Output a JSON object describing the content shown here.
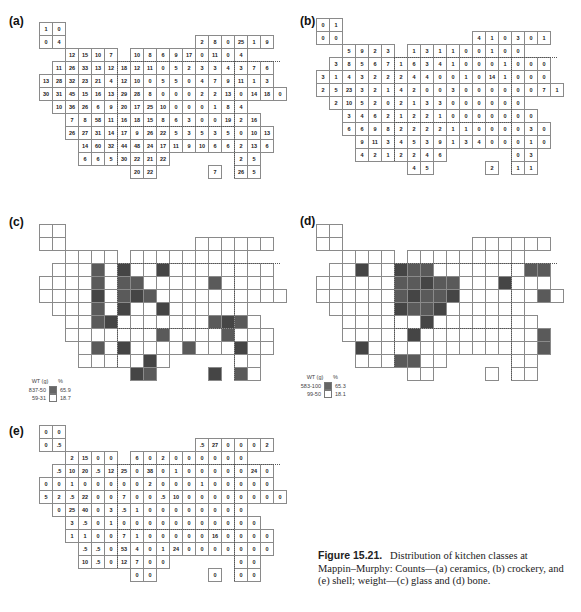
{
  "figure": {
    "number": "Figure 15.21.",
    "caption": "Distribution of kitchen classes at Mappin–Murphy: Counts—(a) ceramics, (b) crockery, and (e) shell; weight—(c) glass and (d) bone."
  },
  "panels": {
    "a": {
      "label": "(a)",
      "kind": "counts",
      "subject": "ceramics",
      "rows": [
        {
          "r": 0,
          "start": 0,
          "vals": [
            "1",
            "0"
          ]
        },
        {
          "r": 1,
          "start": 0,
          "vals": [
            "0",
            "4"
          ]
        },
        {
          "r": 1,
          "start": 12,
          "vals": [
            "2",
            "8",
            "0",
            "25",
            "1",
            "9"
          ]
        },
        {
          "r": 2,
          "start": 2,
          "vals": [
            "12",
            "15",
            "10",
            "7"
          ]
        },
        {
          "r": 2,
          "start": 7,
          "vals": [
            "10",
            "8",
            "6",
            "9",
            "17",
            "0",
            "11",
            "0",
            "4"
          ]
        },
        {
          "r": 3,
          "start": 1,
          "vals": [
            "11",
            "26",
            "33",
            "13",
            "12",
            "18",
            "12",
            "11",
            "0",
            "5",
            "2",
            "3",
            "3",
            "4",
            "3",
            "7",
            "6"
          ]
        },
        {
          "r": 4,
          "start": 0,
          "vals": [
            "13",
            "28",
            "32",
            "23",
            "21",
            "4",
            "12",
            "10",
            "0",
            "5",
            "5",
            "0",
            "4",
            "7",
            "9",
            "11",
            "1",
            "3"
          ]
        },
        {
          "r": 5,
          "start": 0,
          "vals": [
            "30",
            "31",
            "45",
            "15",
            "16",
            "13",
            "29",
            "28",
            "8",
            "0",
            "0",
            "0",
            "2",
            "2",
            "13",
            "0",
            "14",
            "18",
            "0"
          ]
        },
        {
          "r": 6,
          "start": 1,
          "vals": [
            "10",
            "36",
            "26",
            "6",
            "9",
            "20",
            "17",
            "25",
            "10",
            "0",
            "0",
            "0",
            "1",
            "8",
            "4"
          ]
        },
        {
          "r": 7,
          "start": 2,
          "vals": [
            "7",
            "8",
            "58",
            "11",
            "16",
            "18",
            "15",
            "8",
            "6",
            "3",
            "0",
            "0",
            "19",
            "2",
            "16"
          ]
        },
        {
          "r": 8,
          "start": 2,
          "vals": [
            "26",
            "27",
            "31",
            "14",
            "17",
            "9",
            "26",
            "22",
            "5",
            "3",
            "5",
            "3",
            "5",
            "0",
            "10",
            "13"
          ]
        },
        {
          "r": 9,
          "start": 3,
          "vals": [
            "14",
            "60",
            "32",
            "44",
            "48",
            "24",
            "17",
            "11",
            "9",
            "10",
            "6",
            "6",
            "2",
            "13",
            "6"
          ]
        },
        {
          "r": 10,
          "start": 3,
          "vals": [
            "6",
            "6",
            "5",
            "30",
            "22",
            "21",
            "22"
          ]
        },
        {
          "r": 10,
          "start": 15,
          "vals": [
            "2",
            "5"
          ]
        },
        {
          "r": 11,
          "start": 7,
          "vals": [
            "20",
            "22"
          ]
        },
        {
          "r": 11,
          "start": 13,
          "vals": [
            "7"
          ]
        },
        {
          "r": 11,
          "start": 15,
          "vals": [
            "26",
            "5"
          ]
        }
      ]
    },
    "b": {
      "label": "(b)",
      "kind": "counts",
      "subject": "crockery",
      "rows": [
        {
          "r": 0,
          "start": 0,
          "vals": [
            "0",
            "1"
          ]
        },
        {
          "r": 1,
          "start": 0,
          "vals": [
            "0",
            "0"
          ]
        },
        {
          "r": 1,
          "start": 12,
          "vals": [
            "4",
            "1",
            "0",
            "3",
            "0",
            "1"
          ]
        },
        {
          "r": 2,
          "start": 2,
          "vals": [
            "5",
            "9",
            "2",
            "3"
          ]
        },
        {
          "r": 2,
          "start": 7,
          "vals": [
            "1",
            "3",
            "1",
            "1",
            "0",
            "0",
            "1",
            "0",
            "0"
          ]
        },
        {
          "r": 3,
          "start": 1,
          "vals": [
            "3",
            "8",
            "5",
            "6",
            "7",
            "1",
            "6",
            "3",
            "4",
            "1",
            "0",
            "0",
            "0",
            "1",
            "0",
            "0",
            "0"
          ]
        },
        {
          "r": 4,
          "start": 0,
          "vals": [
            "3",
            "1",
            "4",
            "3",
            "2",
            "2",
            "2",
            "4",
            "4",
            "0",
            "0",
            "1",
            "0",
            "14",
            "1",
            "0",
            "0",
            "0"
          ]
        },
        {
          "r": 5,
          "start": 0,
          "vals": [
            "2",
            "5",
            "23",
            "3",
            "2",
            "1",
            "4",
            "2",
            "0",
            "0",
            "3",
            "0",
            "0",
            "0",
            "0",
            "0",
            "0",
            "7",
            "1"
          ]
        },
        {
          "r": 6,
          "start": 1,
          "vals": [
            "2",
            "10",
            "5",
            "2",
            "0",
            "2",
            "1",
            "3",
            "3",
            "0",
            "0",
            "0",
            "0",
            "0",
            "0"
          ]
        },
        {
          "r": 7,
          "start": 2,
          "vals": [
            "3",
            "4",
            "6",
            "2",
            "1",
            "2",
            "2",
            "1",
            "0",
            "0",
            "0",
            "0",
            "0",
            "0",
            "0"
          ]
        },
        {
          "r": 8,
          "start": 2,
          "vals": [
            "6",
            "6",
            "9",
            "8",
            "2",
            "2",
            "2",
            "2",
            "1",
            "1",
            "0",
            "0",
            "0",
            "0",
            "3",
            "0"
          ]
        },
        {
          "r": 9,
          "start": 3,
          "vals": [
            "9",
            "11",
            "3",
            "4",
            "5",
            "3",
            "9",
            "1",
            "3",
            "4",
            "0",
            "0",
            "0",
            "1",
            "0"
          ]
        },
        {
          "r": 10,
          "start": 3,
          "vals": [
            "4",
            "2",
            "1",
            "2",
            "2",
            "4",
            "6"
          ]
        },
        {
          "r": 10,
          "start": 15,
          "vals": [
            "0",
            "3"
          ]
        },
        {
          "r": 11,
          "start": 7,
          "vals": [
            "4",
            "5"
          ]
        },
        {
          "r": 11,
          "start": 13,
          "vals": [
            "2"
          ]
        },
        {
          "r": 11,
          "start": 15,
          "vals": [
            "1",
            "1"
          ]
        }
      ]
    },
    "c": {
      "label": "(c)",
      "kind": "weight",
      "subject": "glass",
      "shaded": [
        [
          3,
          4
        ],
        [
          3,
          6
        ],
        [
          3,
          9
        ],
        [
          4,
          4
        ],
        [
          4,
          6
        ],
        [
          4,
          7
        ],
        [
          4,
          13
        ],
        [
          5,
          4
        ],
        [
          5,
          6
        ],
        [
          5,
          7
        ],
        [
          5,
          8
        ],
        [
          6,
          4
        ],
        [
          6,
          6
        ],
        [
          6,
          9
        ],
        [
          7,
          4
        ],
        [
          7,
          5
        ],
        [
          7,
          13
        ],
        [
          7,
          14
        ],
        [
          7,
          15
        ],
        [
          8,
          9
        ],
        [
          8,
          14
        ],
        [
          9,
          4
        ],
        [
          9,
          6
        ],
        [
          9,
          11
        ],
        [
          9,
          15
        ],
        [
          10,
          8
        ],
        [
          11,
          7
        ],
        [
          11,
          8
        ],
        [
          11,
          13
        ],
        [
          11,
          15
        ]
      ],
      "legend": {
        "header_left": "WT (g)",
        "header_right": "%",
        "items": [
          {
            "range": "837-50",
            "pct": "65.9",
            "shaded": true
          },
          {
            "range": "59-31",
            "pct": "18.7",
            "shaded": false
          }
        ]
      }
    },
    "d": {
      "label": "(d)",
      "kind": "weight",
      "subject": "bone",
      "shaded": [
        [
          3,
          3
        ],
        [
          3,
          6
        ],
        [
          3,
          7
        ],
        [
          3,
          8
        ],
        [
          3,
          16
        ],
        [
          3,
          17
        ],
        [
          4,
          6
        ],
        [
          4,
          7
        ],
        [
          4,
          8
        ],
        [
          4,
          9
        ],
        [
          4,
          10
        ],
        [
          4,
          14
        ],
        [
          5,
          6
        ],
        [
          5,
          7
        ],
        [
          5,
          8
        ],
        [
          5,
          9
        ],
        [
          5,
          10
        ],
        [
          5,
          17
        ],
        [
          6,
          6
        ],
        [
          6,
          7
        ],
        [
          6,
          8
        ],
        [
          6,
          9
        ],
        [
          7,
          8
        ],
        [
          8,
          7
        ],
        [
          8,
          17
        ],
        [
          9,
          3
        ],
        [
          9,
          17
        ],
        [
          10,
          6
        ],
        [
          10,
          7
        ]
      ],
      "legend": {
        "header_left": "WT (g)",
        "header_right": "%",
        "items": [
          {
            "range": "583-100",
            "pct": "65.3",
            "shaded": true
          },
          {
            "range": "99-50",
            "pct": "18.1",
            "shaded": false
          }
        ]
      }
    },
    "e": {
      "label": "(e)",
      "kind": "counts",
      "subject": "shell",
      "rows": [
        {
          "r": 0,
          "start": 0,
          "vals": [
            "0",
            "0"
          ]
        },
        {
          "r": 1,
          "start": 0,
          "vals": [
            "0",
            ".5"
          ]
        },
        {
          "r": 1,
          "start": 12,
          "vals": [
            ".5",
            "27",
            "0",
            "0",
            "0",
            "2"
          ]
        },
        {
          "r": 2,
          "start": 2,
          "vals": [
            "2",
            "15",
            "0",
            "0"
          ]
        },
        {
          "r": 2,
          "start": 7,
          "vals": [
            "6",
            "0",
            "2",
            "0",
            "0",
            "0",
            "0",
            "0",
            "0"
          ]
        },
        {
          "r": 3,
          "start": 1,
          "vals": [
            ".5",
            "10",
            "20",
            ".5",
            "12",
            "25",
            "0",
            "38",
            "0",
            "1",
            "0",
            "0",
            "0",
            "0",
            "0",
            "24",
            "0"
          ]
        },
        {
          "r": 4,
          "start": 0,
          "vals": [
            "0",
            "0",
            "1",
            "0",
            "0",
            "0",
            "0",
            "0",
            "2",
            "0",
            "0",
            "0",
            "1",
            "0",
            "0",
            "0",
            "0",
            "0"
          ]
        },
        {
          "r": 5,
          "start": 0,
          "vals": [
            "5",
            "2",
            ".5",
            "22",
            "0",
            "0",
            "7",
            "0",
            "0",
            ".5",
            "10",
            "0",
            "0",
            "0",
            "0",
            "0",
            "0",
            "0",
            "0"
          ]
        },
        {
          "r": 6,
          "start": 1,
          "vals": [
            "0",
            "25",
            "40",
            "0",
            "3",
            ".5",
            "1",
            "0",
            "0",
            "0",
            "0",
            "0",
            "0",
            "0",
            "0"
          ]
        },
        {
          "r": 7,
          "start": 2,
          "vals": [
            "3",
            ".5",
            "0",
            "1",
            "0",
            "0",
            "0",
            "0",
            "0",
            "0",
            "0",
            "0",
            "0",
            "0",
            "0"
          ]
        },
        {
          "r": 8,
          "start": 2,
          "vals": [
            "1",
            "1",
            "0",
            "0",
            "7",
            "1",
            "0",
            "0",
            "0",
            "0",
            "0",
            "16",
            "0",
            "0",
            "0",
            "0"
          ]
        },
        {
          "r": 9,
          "start": 3,
          "vals": [
            ".5",
            ".5",
            "0",
            "53",
            "4",
            "0",
            "1",
            "24",
            "0",
            "0",
            "0",
            "0",
            "0",
            "0",
            "0"
          ]
        },
        {
          "r": 10,
          "start": 3,
          "vals": [
            "10",
            ".5",
            "0",
            "12",
            "7",
            "0",
            "0"
          ]
        },
        {
          "r": 10,
          "start": 15,
          "vals": [
            "0",
            "0"
          ]
        },
        {
          "r": 11,
          "start": 7,
          "vals": [
            "0",
            "0"
          ]
        },
        {
          "r": 11,
          "start": 13,
          "vals": [
            "0"
          ]
        },
        {
          "r": 11,
          "start": 15,
          "vals": [
            "0",
            "0"
          ]
        }
      ]
    }
  },
  "colors": {
    "shaded_cell": "#5a5a5a",
    "grid_line": "#8a8a8a",
    "boundary_dotted": "#555555"
  }
}
